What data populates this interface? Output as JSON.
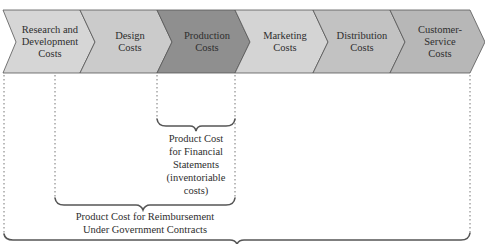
{
  "diagram": {
    "segments": [
      {
        "label": "Research and Development Costs",
        "lines": [
          "Research and",
          "Development",
          "Costs"
        ],
        "fill": "#d6d6d6"
      },
      {
        "label": "Design Costs",
        "lines": [
          "Design",
          "Costs"
        ],
        "fill": "#cbcbcb"
      },
      {
        "label": "Production Costs",
        "lines": [
          "Production",
          "Costs"
        ],
        "fill": "#8f8f8f"
      },
      {
        "label": "Marketing Costs",
        "lines": [
          "Marketing",
          "Costs"
        ],
        "fill": "#d4d4d4"
      },
      {
        "label": "Distribution Costs",
        "lines": [
          "Distribution",
          "Costs"
        ],
        "fill": "#c2c2c2"
      },
      {
        "label": "Customer-Service Costs",
        "lines": [
          "Customer-",
          "Service",
          "Costs"
        ],
        "fill": "#b7b7b7"
      }
    ],
    "brackets": [
      {
        "name": "financial-statements",
        "lines": [
          "Product Cost",
          "for Financial",
          "Statements",
          "(inventoriable",
          "costs)"
        ],
        "spans": "Production Costs"
      },
      {
        "name": "government-contracts",
        "lines": [
          "Product Cost for Reimbursement",
          "Under Government Contracts"
        ],
        "spans": "Design Costs through Production Costs"
      },
      {
        "name": "all-costs",
        "lines": [],
        "spans": "Research and Development Costs through Customer-Service Costs"
      }
    ]
  }
}
